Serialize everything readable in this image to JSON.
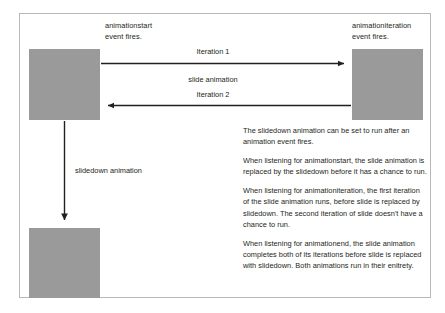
{
  "figure": {
    "frame_border_color": "#b8b8b8",
    "box_color": "#9a9a9a",
    "text_color": "#231f20",
    "boxes": [
      {
        "id": "box-start",
        "name": "element-initial-state"
      },
      {
        "id": "box-right",
        "name": "element-slid-right-state"
      },
      {
        "id": "box-bottom",
        "name": "element-slid-down-state"
      }
    ],
    "labels": {
      "animationstart": "animationstart\nevent fires.",
      "animationiteration": "animationiteration\nevent fires.",
      "iteration_1": "Iteration 1",
      "slide_animation": "slide animation",
      "iteration_2": "Iteration 2",
      "slidedown_animation": "slidedown animation"
    },
    "prose": [
      "The slidedown animation can be set to run after an animation event fires.",
      "When listening for animationstart, the slide animation is replaced by the slidedown before it has a chance to run.",
      "When listening for animationiteration, the first iteration of the slide animation runs, before slide is replaced by slidedown. The second iteration of slide doesn't have a chance to run.",
      "When listening for animationend, the slide animation completes both of its iterations before slide is replaced with slidedown. Both animations run in their enitrety."
    ]
  }
}
